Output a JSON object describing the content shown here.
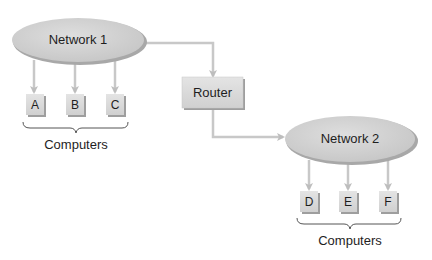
{
  "colors": {
    "node_fill": "#d2d2d2",
    "node_shadow": "#9a9a9a",
    "box_fill": "#dcdcdc",
    "connector": "#c4c4c4",
    "text": "#1e1e1e"
  },
  "networks": [
    {
      "id": "network1",
      "label": "Network 1"
    },
    {
      "id": "network2",
      "label": "Network 2"
    }
  ],
  "router": {
    "label": "Router"
  },
  "groups": [
    {
      "network": "network1",
      "computers": [
        "A",
        "B",
        "C"
      ],
      "label": "Computers"
    },
    {
      "network": "network2",
      "computers": [
        "D",
        "E",
        "F"
      ],
      "label": "Computers"
    }
  ],
  "edges": [
    {
      "from": "Network 1",
      "to": "Router"
    },
    {
      "from": "Router",
      "to": "Network 2"
    },
    {
      "from": "Network 1",
      "to": "A"
    },
    {
      "from": "Network 1",
      "to": "B"
    },
    {
      "from": "Network 1",
      "to": "C"
    },
    {
      "from": "Network 2",
      "to": "D"
    },
    {
      "from": "Network 2",
      "to": "E"
    },
    {
      "from": "Network 2",
      "to": "F"
    }
  ]
}
